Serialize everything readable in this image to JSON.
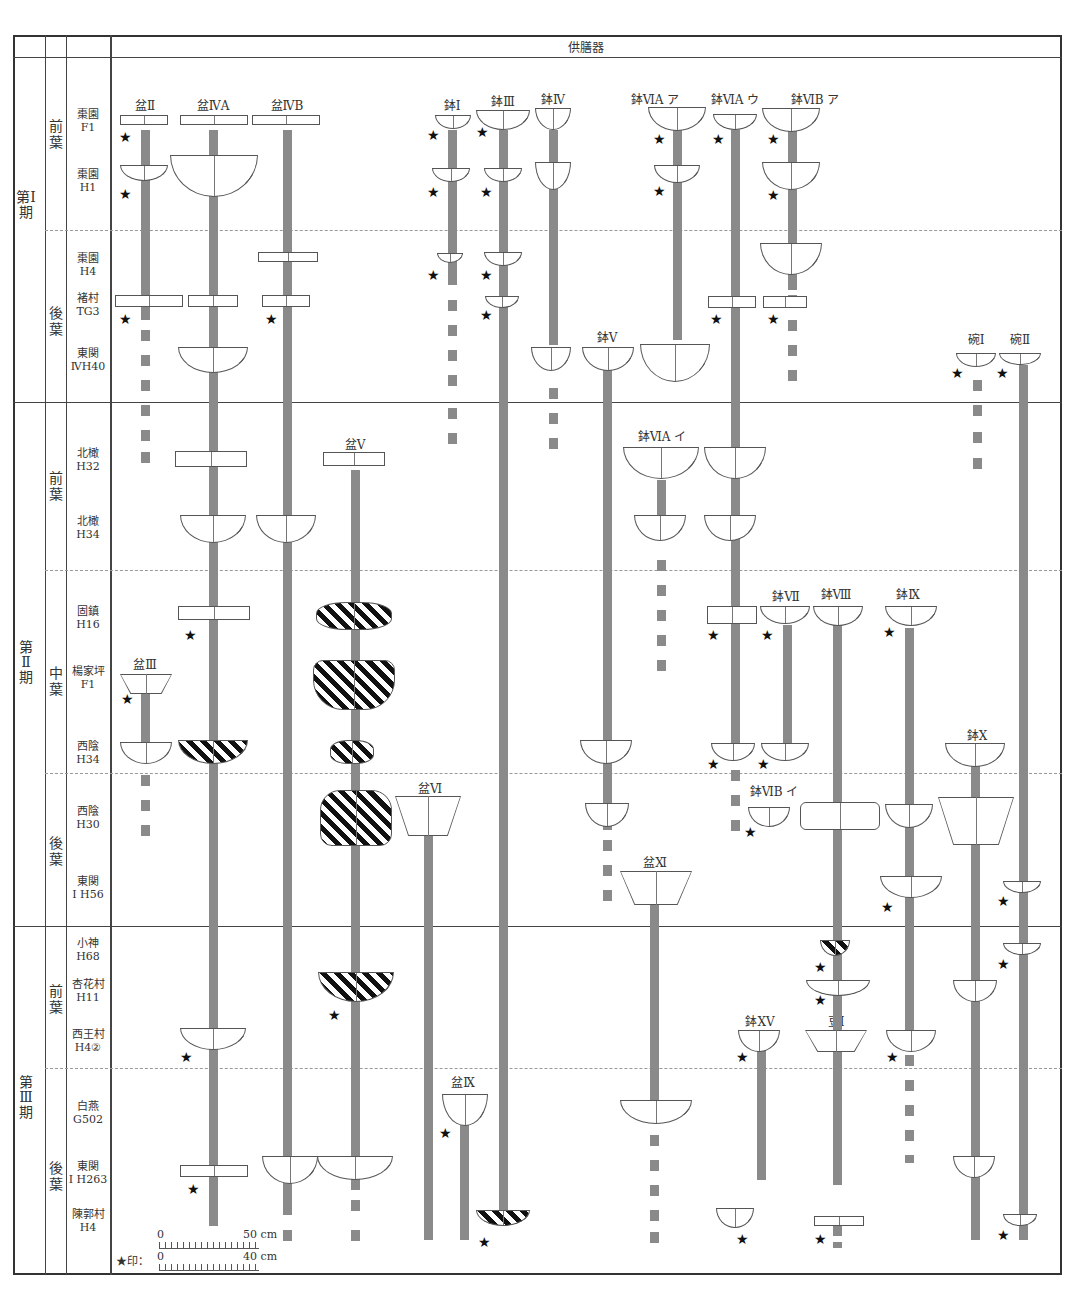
{
  "header": {
    "title": "供膳器"
  },
  "periods": [
    {
      "label": "第Ⅰ期",
      "subperiods": [
        {
          "label": "前葉",
          "sites": [
            {
              "name": "棗園",
              "code": "F1"
            },
            {
              "name": "棗園",
              "code": "H1"
            }
          ]
        },
        {
          "label": "後葉",
          "sites": [
            {
              "name": "棗園",
              "code": "H4"
            },
            {
              "name": "褚村",
              "code": "TG3"
            },
            {
              "name": "東関",
              "code": "ⅣH40"
            }
          ]
        }
      ]
    },
    {
      "label": "第Ⅱ期",
      "subperiods": [
        {
          "label": "前葉",
          "sites": [
            {
              "name": "北橄",
              "code": "H32"
            },
            {
              "name": "北橄",
              "code": "H34"
            }
          ]
        },
        {
          "label": "中葉",
          "sites": [
            {
              "name": "固鎮",
              "code": "H16"
            },
            {
              "name": "楊家坪",
              "code": "F1"
            },
            {
              "name": "西陰",
              "code": "H34"
            }
          ]
        },
        {
          "label": "後葉",
          "sites": [
            {
              "name": "西陰",
              "code": "H30"
            },
            {
              "name": "東関",
              "code": "Ⅰ H56"
            }
          ]
        }
      ]
    },
    {
      "label": "第Ⅲ期",
      "subperiods": [
        {
          "label": "前葉",
          "sites": [
            {
              "name": "小神",
              "code": "H68"
            },
            {
              "name": "杏花村",
              "code": "H11"
            },
            {
              "name": "西王村",
              "code": "H4②"
            }
          ]
        },
        {
          "label": "後葉",
          "sites": [
            {
              "name": "白燕",
              "code": "G502"
            },
            {
              "name": "東関",
              "code": "Ⅰ H263"
            },
            {
              "name": "陳郭村",
              "code": "H4"
            }
          ]
        }
      ]
    }
  ],
  "types": {
    "pen2": "盆Ⅱ",
    "pen4a": "盆ⅣA",
    "pen4b": "盆ⅣB",
    "bo1": "鉢Ⅰ",
    "bo3": "鉢Ⅲ",
    "bo4": "鉢Ⅳ",
    "bo6aa": "鉢ⅥA ア",
    "bo6au": "鉢ⅥA ウ",
    "bo6ba": "鉢ⅥB ア",
    "bo5": "鉢Ⅴ",
    "wan1": "碗Ⅰ",
    "wan2": "碗Ⅱ",
    "pen5": "盆Ⅴ",
    "bo6ai": "鉢ⅥA イ",
    "bo7": "鉢Ⅶ",
    "bo8": "鉢Ⅷ",
    "bo9": "鉢Ⅸ",
    "pen3": "盆Ⅲ",
    "bo10": "鉢Ⅹ",
    "pen6": "盆Ⅵ",
    "bo6bi": "鉢ⅥB イ",
    "pen11": "盆Ⅺ",
    "bo15": "鉢ⅩⅤ",
    "dou1": "豆Ⅰ",
    "pen9": "盆Ⅸ"
  },
  "scale": {
    "top_zero": "0",
    "top_len": "50 cm",
    "bottom_prefix": "★印：",
    "bottom_zero": "0",
    "bottom_len": "40 cm"
  },
  "symbols": {
    "star": "★"
  },
  "colors": {
    "bar": "#8a8a8a",
    "line": "#444444"
  }
}
